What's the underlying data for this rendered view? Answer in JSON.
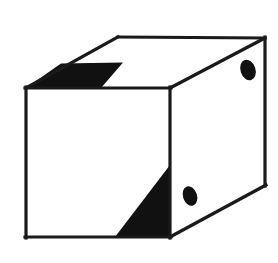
{
  "figure": {
    "title": "Line drawing of a cube with shaded wedges and two dark ellipses",
    "subject": "cube",
    "style": "black line art on white background",
    "canvas": {
      "width": 278,
      "height": 263,
      "background": "#ffffff"
    },
    "colors": {
      "background": "#ffffff",
      "stroke": "#1a1a1a",
      "fill_face": "#ffffff",
      "fill_shadow": "#111111",
      "fill_marker": "#111111"
    },
    "stroke_width": 3.2,
    "faces": [
      {
        "name": "top-face",
        "label": "top face",
        "points": "26,88 118,37 265,38 170,88",
        "fill": "#ffffff"
      },
      {
        "name": "front-face",
        "label": "front left face",
        "points": "26,88 170,88 170,237 26,237",
        "fill": "#ffffff"
      },
      {
        "name": "right-face",
        "label": "right side face",
        "points": "170,88 265,38 265,185 170,237",
        "fill": "#ffffff"
      }
    ],
    "shadows": [
      {
        "name": "top-left-wedge",
        "label": "dark triangular wedge at top-left of top face",
        "points": "26,88 100,88 122,63 62,63",
        "fill": "#111111"
      },
      {
        "name": "front-bottom-wedge",
        "label": "dark triangular wedge at bottom-right of front face",
        "points": "170,166 170,237 116,237",
        "fill": "#111111"
      }
    ],
    "markers": [
      {
        "name": "marker-ellipse-right-face",
        "label": "dark ellipse on right face (upper)",
        "cx": 248,
        "cy": 70,
        "rx": 7.5,
        "ry": 10.5,
        "rotation": -18,
        "fill": "#111111"
      },
      {
        "name": "marker-ellipse-front-face",
        "label": "dark ellipse near bottom of right face (lower)",
        "cx": 190,
        "cy": 196,
        "rx": 7,
        "ry": 10,
        "rotation": -18,
        "fill": "#111111"
      }
    ],
    "edges": [
      {
        "name": "edge-top-back",
        "from": "118,37",
        "to": "265,38"
      },
      {
        "name": "edge-top-left",
        "from": "26,88",
        "to": "118,37"
      },
      {
        "name": "edge-top-front",
        "from": "26,88",
        "to": "170,88"
      },
      {
        "name": "edge-top-right",
        "from": "170,88",
        "to": "265,38"
      },
      {
        "name": "edge-front-left-vertical",
        "from": "26,88",
        "to": "26,237"
      },
      {
        "name": "edge-front-right-vertical",
        "from": "170,88",
        "to": "170,237"
      },
      {
        "name": "edge-front-bottom",
        "from": "26,237",
        "to": "170,237"
      },
      {
        "name": "edge-right-vertical",
        "from": "265,38",
        "to": "265,185"
      },
      {
        "name": "edge-right-bottom",
        "from": "170,237",
        "to": "265,185"
      }
    ]
  }
}
